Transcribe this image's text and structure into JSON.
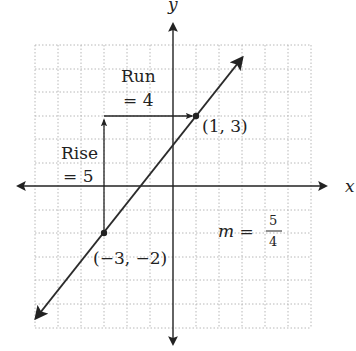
{
  "axes": {
    "x_label": "x",
    "y_label": "y"
  },
  "grid": {
    "x_min": -6,
    "x_max": 6,
    "y_min": -6,
    "y_max": 6,
    "style": "dotted"
  },
  "line": {
    "equation_slope": "5/4",
    "points": [
      {
        "x": 1,
        "y": 3,
        "label": "(1, 3)"
      },
      {
        "x": -3,
        "y": -2,
        "label": "(−3, −2)"
      }
    ]
  },
  "annotations": {
    "run_label": "Run",
    "run_value": "= 4",
    "rise_label": "Rise",
    "rise_value": "= 5",
    "slope_m": "m =",
    "slope_num": "5",
    "slope_den": "4"
  },
  "colors": {
    "line": "#2b2b2b",
    "grid": "#b8b8b8",
    "text": "#222222"
  }
}
